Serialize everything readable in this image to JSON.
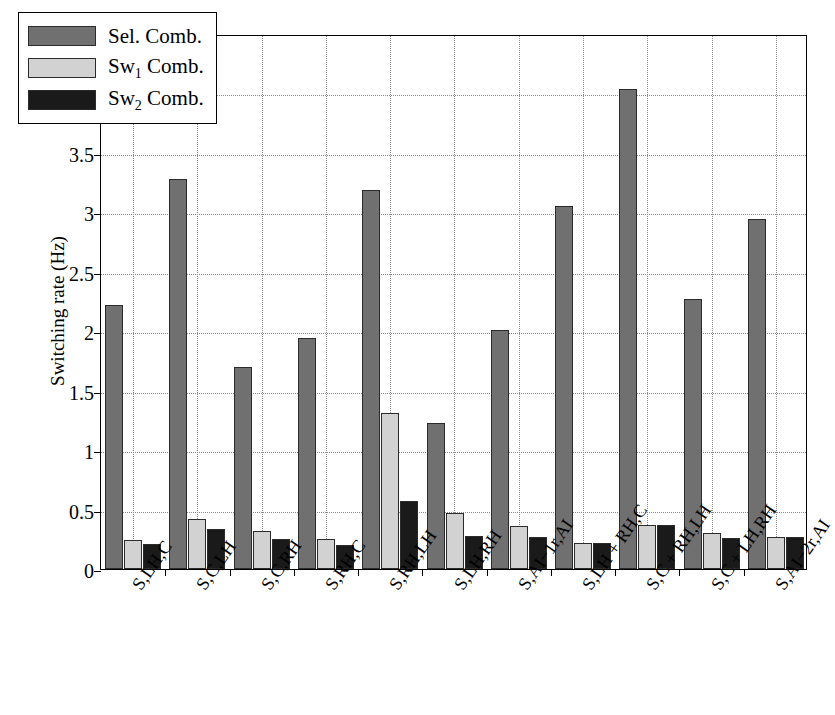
{
  "chart_data": {
    "type": "bar",
    "title": "",
    "xlabel": "",
    "ylabel": "Switching rate (Hz)",
    "ylim": [
      0,
      4.5
    ],
    "ytick_labels": [
      "0",
      "0.5",
      "1",
      "1.5",
      "2",
      "2.5",
      "3",
      "3.5",
      "4",
      "4.5"
    ],
    "ytick_values": [
      0,
      0.5,
      1,
      1.5,
      2,
      2.5,
      3,
      3.5,
      4,
      4.5
    ],
    "grid": true,
    "legend_position": "upper-left-inside",
    "categories": [
      "S,LH,C",
      "S,C,LH",
      "S,C,RH",
      "S,RH,C",
      "S,RH,LH",
      "S,LH,RH",
      "S,AI−1r,AI",
      "S,LH + RH,C",
      "S,C + RH,LH",
      "S,C + LH,RH",
      "S,AI−2r,AI"
    ],
    "series": [
      {
        "name": "Sel. Comb.",
        "color": "#707070",
        "values": [
          2.22,
          3.28,
          1.7,
          1.94,
          3.19,
          1.23,
          2.01,
          3.05,
          4.04,
          2.27,
          2.94
        ]
      },
      {
        "name": "Sw1 Comb.",
        "color": "#d2d2d2",
        "values": [
          0.24,
          0.42,
          0.32,
          0.25,
          1.31,
          0.47,
          0.36,
          0.22,
          0.37,
          0.3,
          0.27
        ]
      },
      {
        "name": "Sw2 Comb.",
        "color": "#1a1a1a",
        "values": [
          0.21,
          0.34,
          0.25,
          0.2,
          0.57,
          0.28,
          0.27,
          0.22,
          0.37,
          0.26,
          0.27
        ]
      }
    ]
  },
  "legend": {
    "entries": [
      {
        "label_main": "Sel. Comb.",
        "label_prefix": "Sel. Comb.",
        "sub": "",
        "label_suffix": ""
      },
      {
        "label_main": "Sw1 Comb.",
        "label_prefix": "Sw",
        "sub": "1",
        "label_suffix": " Comb."
      },
      {
        "label_main": "Sw2 Comb.",
        "label_prefix": "Sw",
        "sub": "2",
        "label_suffix": " Comb."
      }
    ]
  },
  "axis": {
    "y_title": "Switching rate (Hz)"
  }
}
